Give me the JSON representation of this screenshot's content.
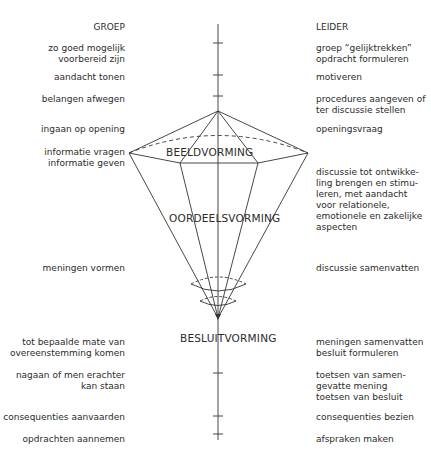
{
  "headers": {
    "left": "GROEP",
    "right": "LEIDER"
  },
  "phases": {
    "beeldvorming": "BEELDVORMING",
    "oordeelsvorming": "OORDEELSVORMING",
    "besluitvorming": "BESLUITVORMING"
  },
  "groep": [
    "zo goed mogelijk\nvoorbereid zijn",
    "aandacht tonen",
    "belangen afwegen",
    "ingaan op opening",
    "informatie vragen\ninformatie geven",
    "meningen vormen",
    "tot bepaalde mate van\novereenstemming komen",
    "nagaan of men erachter\nkan staan",
    "consequenties aanvaarden",
    "opdrachten aannemen"
  ],
  "leider": [
    "groep “gelijktrekken”\nopdracht formuleren",
    "motiveren",
    "procedures aangeven of\nter discussie stellen",
    "openingsvraag",
    "discussie tot ontwikke-\nling brengen en stimu-\nleren, met aandacht\nvoor relationele,\nemotionele en zakelijke\naspecten",
    "discussie samenvatten",
    "meningen samenvatten\nbesluit formuleren",
    "toetsen van samen-\ngevatte mening\ntoetsen van besluit",
    "consequenties bezien",
    "afspraken maken"
  ]
}
